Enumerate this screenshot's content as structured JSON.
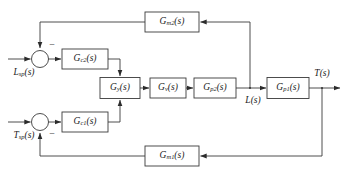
{
  "diagram": {
    "colors": {
      "line": "#3a3a3a",
      "block_fill": "#ffffff",
      "text": "#1d1d1d",
      "background": "#ffffff"
    },
    "blocks": [
      {
        "id": "gm2",
        "label": "Gm2(s)",
        "base": "G",
        "sub": "m2",
        "arg": "(s)",
        "x": 172,
        "y": 22,
        "w": 54,
        "h": 20
      },
      {
        "id": "gc2",
        "label": "Gc2(s)",
        "base": "G",
        "sub": "c2",
        "arg": "(s)",
        "x": 85,
        "y": 59,
        "w": 46,
        "h": 20
      },
      {
        "id": "gy",
        "label": "Gy(s)",
        "base": "G",
        "sub": "y",
        "arg": "(s)",
        "x": 120,
        "y": 88,
        "w": 40,
        "h": 21
      },
      {
        "id": "gv",
        "label": "Gv(s)",
        "base": "G",
        "sub": "v",
        "arg": "(s)",
        "x": 168,
        "y": 88,
        "w": 36,
        "h": 20
      },
      {
        "id": "gp2",
        "label": "Gp2(s)",
        "base": "G",
        "sub": "p2",
        "arg": "(s)",
        "x": 215,
        "y": 88,
        "w": 42,
        "h": 20
      },
      {
        "id": "gp1",
        "label": "Gp1(s)",
        "base": "G",
        "sub": "p1",
        "arg": "(s)",
        "x": 288,
        "y": 88,
        "w": 42,
        "h": 21
      },
      {
        "id": "gc1",
        "label": "Gc1(s)",
        "base": "G",
        "sub": "c1",
        "arg": "(s)",
        "x": 85,
        "y": 122,
        "w": 46,
        "h": 20
      },
      {
        "id": "gm1",
        "label": "Gm1(s)",
        "base": "G",
        "sub": "m1",
        "arg": "(s)",
        "x": 172,
        "y": 156,
        "w": 54,
        "h": 20
      }
    ],
    "summing_junctions": [
      {
        "id": "sum-outer",
        "x": 40,
        "y": 59,
        "r": 8.5,
        "sign": "−",
        "sign_x": 52,
        "sign_y": 45
      },
      {
        "id": "sum-inner",
        "x": 40,
        "y": 122,
        "r": 8.5,
        "sign": "−",
        "sign_x": 52,
        "sign_y": 134
      }
    ],
    "signals": [
      {
        "id": "lsp",
        "base": "L",
        "sub": "sp",
        "arg": "(s)",
        "label": "Lsp(s)",
        "x": 24,
        "y": 73
      },
      {
        "id": "tsp",
        "base": "T",
        "sub": "sp",
        "arg": "(s)",
        "label": "Tsp(s)",
        "x": 24,
        "y": 136
      },
      {
        "id": "l",
        "base": "L",
        "sub": "",
        "arg": "(s)",
        "label": "L(s)",
        "x": 253,
        "y": 101
      },
      {
        "id": "t",
        "base": "T",
        "sub": "",
        "arg": "(s)",
        "label": "T(s)",
        "x": 322,
        "y": 74
      }
    ]
  }
}
